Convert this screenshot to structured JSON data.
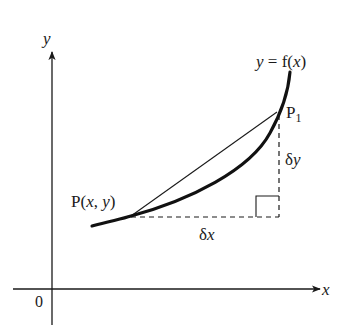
{
  "diagram": {
    "axes": {
      "x_label": "x",
      "y_label": "y",
      "origin_label": "0"
    },
    "curve": {
      "label": "y = f(x)",
      "label_lhs": "y",
      "label_eq": " = f(",
      "label_var": "x",
      "label_close": ")"
    },
    "points": {
      "P": {
        "label": "P(x, y)",
        "prefix": "P(",
        "x": "x",
        "sep": ", ",
        "y": "y",
        "suffix": ")"
      },
      "P1": {
        "label": "P1",
        "base": "P",
        "sub": "1"
      }
    },
    "increments": {
      "dx": {
        "label": "δx",
        "delta": "δ",
        "var": "x"
      },
      "dy": {
        "label": "δy",
        "delta": "δ",
        "var": "y"
      }
    },
    "colors": {
      "ink": "#1a1a1a",
      "background": "#ffffff"
    }
  }
}
